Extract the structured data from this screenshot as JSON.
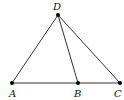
{
  "figure": {
    "type": "triangle-with-cevian",
    "points": [
      {
        "id": "A",
        "label": "A",
        "x": 12,
        "y": 83,
        "label_x": 9,
        "label_y": 97
      },
      {
        "id": "B",
        "label": "B",
        "x": 78,
        "y": 83,
        "label_x": 74,
        "label_y": 97
      },
      {
        "id": "C",
        "label": "C",
        "x": 120,
        "y": 83,
        "label_x": 114,
        "label_y": 97
      },
      {
        "id": "D",
        "label": "D",
        "x": 58,
        "y": 15,
        "label_x": 53,
        "label_y": 10
      }
    ],
    "segments": [
      {
        "from": "A",
        "to": "C"
      },
      {
        "from": "A",
        "to": "D"
      },
      {
        "from": "D",
        "to": "B"
      },
      {
        "from": "D",
        "to": "C"
      }
    ],
    "colors": {
      "line": "#333333",
      "point": "#000000",
      "label": "#111111"
    }
  }
}
